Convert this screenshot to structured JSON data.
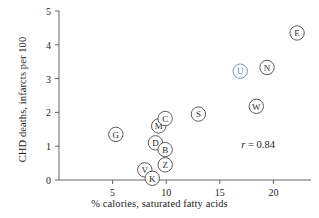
{
  "chart_data": {
    "type": "scatter",
    "title": "",
    "xlabel": "% calories, saturated fatty acids",
    "ylabel": "CHD deaths, infarcts per 100",
    "xlim": [
      0,
      23.5
    ],
    "ylim": [
      0,
      5
    ],
    "xticks": [
      5,
      10,
      15,
      20
    ],
    "yticks": [
      0,
      1,
      2,
      3,
      4,
      5
    ],
    "grid": false,
    "legend": null,
    "annotations": [
      {
        "name": "correlation",
        "symbol": "r",
        "text": " = 0.84",
        "value": 0.84
      }
    ],
    "point_label_kind": "country-code-letter",
    "points": [
      {
        "label": "G",
        "x": 5.3,
        "y": 1.35,
        "highlight": false
      },
      {
        "label": "V",
        "x": 8.0,
        "y": 0.3,
        "highlight": false
      },
      {
        "label": "K",
        "x": 8.7,
        "y": 0.05,
        "highlight": false
      },
      {
        "label": "D",
        "x": 9.0,
        "y": 1.1,
        "highlight": false
      },
      {
        "label": "M",
        "x": 9.3,
        "y": 1.6,
        "highlight": false
      },
      {
        "label": "C",
        "x": 9.9,
        "y": 1.82,
        "highlight": false
      },
      {
        "label": "B",
        "x": 9.9,
        "y": 0.9,
        "highlight": false
      },
      {
        "label": "Z",
        "x": 9.9,
        "y": 0.45,
        "highlight": false
      },
      {
        "label": "S",
        "x": 13.0,
        "y": 1.95,
        "highlight": false
      },
      {
        "label": "U",
        "x": 16.9,
        "y": 3.22,
        "highlight": true
      },
      {
        "label": "W",
        "x": 18.4,
        "y": 2.18,
        "highlight": false
      },
      {
        "label": "N",
        "x": 19.4,
        "y": 3.33,
        "highlight": false
      },
      {
        "label": "E",
        "x": 22.2,
        "y": 4.35,
        "highlight": false
      }
    ]
  },
  "colors": {
    "axis": "#555555",
    "marker_stroke": "#4a4a4a",
    "marker_fill": "#ffffff",
    "highlight": "#5a86c4",
    "text": "#1d1d1d",
    "background": "#ffffff"
  }
}
